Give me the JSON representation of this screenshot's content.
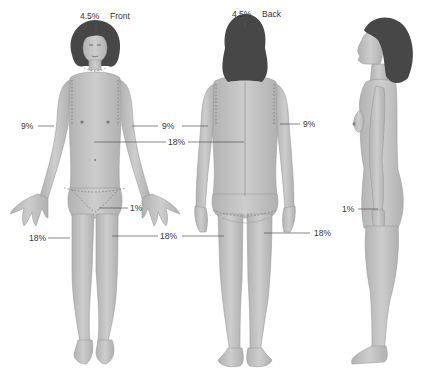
{
  "diagram": {
    "colors": {
      "skin": "#c4c4c4",
      "skin_shade": "#a9a9a9",
      "hair": "#4a4a4a",
      "leader_line": "#555555",
      "text": "#333333",
      "dashed_boundary": "#7a7a7a"
    },
    "views": {
      "front": {
        "view_label": "Front",
        "head": "4.5%",
        "left_arm": "9%",
        "right_arm": "9%",
        "trunk": "18%",
        "genitalia": "1%",
        "left_leg": "18%",
        "right_leg": "18%"
      },
      "back": {
        "view_label": "Back",
        "head": "4.5%",
        "right_arm": "9%",
        "left_arm": "9%",
        "trunk": "18%",
        "right_leg": "18%",
        "left_leg": "18%"
      },
      "side": {
        "palm": "1%"
      }
    }
  }
}
